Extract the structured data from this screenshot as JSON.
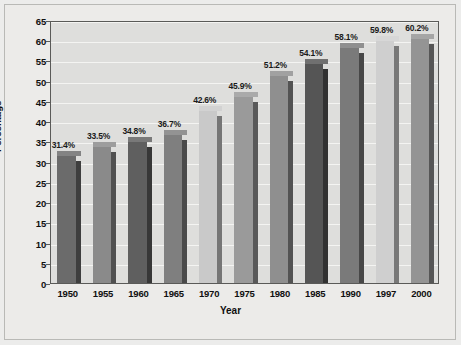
{
  "chart_data": {
    "type": "bar",
    "title": "",
    "xlabel": "Year",
    "ylabel": "Percentage",
    "categories": [
      "1950",
      "1955",
      "1960",
      "1965",
      "1970",
      "1975",
      "1980",
      "1985",
      "1990",
      "1997",
      "2000"
    ],
    "values": [
      31.4,
      33.5,
      34.8,
      36.7,
      42.6,
      45.9,
      51.2,
      54.1,
      58.1,
      59.8,
      60.2
    ],
    "value_labels": [
      "31.4%",
      "33.5%",
      "34.8%",
      "36.7%",
      "42.6%",
      "45.9%",
      "51.2%",
      "54.1%",
      "58.1%",
      "59.8%",
      "60.2%"
    ],
    "bar_colors": [
      "#6b6b6b",
      "#8a8a8a",
      "#5f5f5f",
      "#7f7f7f",
      "#c9c9c9",
      "#9a9a9a",
      "#8f8f8f",
      "#555555",
      "#7a7a7a",
      "#cfcfcf",
      "#949494"
    ],
    "ylim": [
      0,
      65
    ],
    "yticks": [
      "0",
      "5",
      "10",
      "15",
      "20",
      "25",
      "30",
      "35",
      "40",
      "45",
      "50",
      "55",
      "60",
      "65"
    ],
    "ytick_values": [
      0,
      5,
      10,
      15,
      20,
      25,
      30,
      35,
      40,
      45,
      50,
      55,
      60,
      65
    ],
    "grid": true,
    "legend": "none",
    "plot_background": "#dededc",
    "gridline_color": "#f4f4f2",
    "page_background": "#ececeb"
  }
}
